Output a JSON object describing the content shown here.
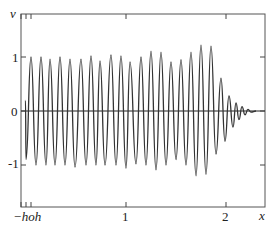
{
  "chart_data": {
    "type": "line",
    "title": "",
    "xlabel": "x",
    "ylabel": "v",
    "xlim": [
      -0.05,
      2.39
    ],
    "ylim": [
      -1.78,
      1.8
    ],
    "grid": false,
    "legend": null,
    "x_ticks": [
      {
        "value": -0.05,
        "label": "−h"
      },
      {
        "value": 0,
        "label": "o"
      },
      {
        "value": 0.05,
        "label": "h"
      },
      {
        "value": 1,
        "label": "1"
      },
      {
        "value": 2,
        "label": "2"
      }
    ],
    "x_tick_label_text": "−hoh",
    "y_ticks": [
      {
        "value": 1,
        "label": "1"
      },
      {
        "value": 0,
        "label": "0"
      },
      {
        "value": -1,
        "label": "-1"
      }
    ],
    "series": [
      {
        "name": "v(x)",
        "description": "Oscillatory solution with period ≈ 0.1, amplitude ≈ 1 growing slightly to ≈1.2 near x≈1.7, then rapidly decaying to 0 after x≈1.9",
        "peaks_x": [
          0.05,
          0.15,
          0.24,
          0.34,
          0.44,
          0.55,
          0.65,
          0.74,
          0.85,
          0.95,
          1.04,
          1.15,
          1.25,
          1.35,
          1.45,
          1.55,
          1.65,
          1.75,
          1.85,
          1.95,
          2.03,
          2.1,
          2.16,
          2.22
        ],
        "peaks_y": [
          1.0,
          1.0,
          0.96,
          1.0,
          0.96,
          0.96,
          1.02,
          0.93,
          1.04,
          1.02,
          0.91,
          1.0,
          1.11,
          1.09,
          0.91,
          0.95,
          1.09,
          1.22,
          1.2,
          0.61,
          0.28,
          0.15,
          0.08,
          0.03
        ],
        "troughs_x": [
          0.0,
          0.1,
          0.2,
          0.29,
          0.39,
          0.49,
          0.6,
          0.7,
          0.79,
          0.9,
          1.0,
          1.1,
          1.2,
          1.3,
          1.4,
          1.5,
          1.6,
          1.7,
          1.8,
          1.9,
          1.99,
          2.07,
          2.13,
          2.19,
          2.25
        ],
        "troughs_y": [
          -0.9,
          -1.0,
          -1.0,
          -1.0,
          -1.0,
          -1.04,
          -1.0,
          -1.0,
          -1.0,
          -1.0,
          -1.06,
          -0.98,
          -1.0,
          -1.09,
          -1.0,
          -0.9,
          -1.0,
          -1.2,
          -1.17,
          -0.8,
          -0.56,
          -0.3,
          -0.16,
          -0.07,
          -0.02
        ]
      }
    ]
  }
}
